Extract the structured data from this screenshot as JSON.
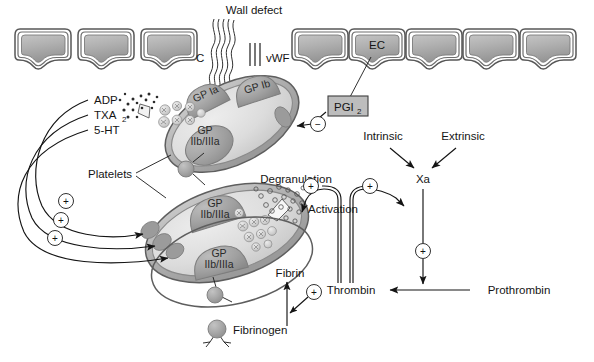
{
  "figure": {
    "title": "Wall defect",
    "background_color": "#ffffff"
  },
  "colors": {
    "cell_fill_light": "#b9b9b9",
    "cell_fill_dark": "#9a9a9a",
    "cell_border": "#6e6e6e",
    "cell_outline": "#4d4d4d",
    "platelet_fill": "#d9d9d9",
    "platelet_membrane": "#a8a8a8",
    "receptor_fill": "#9d9d9d",
    "granule_fill": "#c9c9c9",
    "sphere_fill": "#a3a3a3",
    "line": "#1a1a1a",
    "box_fill": "#bdbdbd",
    "text": "#151515"
  },
  "labels": {
    "wall_defect": "Wall defect",
    "collagen": "C",
    "vwf": "vWF",
    "endothelial_cell": "EC",
    "pgi2": "PGI",
    "pgi2_sub": "2",
    "adp": "ADP",
    "txa2": "TXA",
    "txa2_sub": "2",
    "serotonin": "5-HT",
    "platelets": "Platelets",
    "gp_ia": "GP Ia",
    "gp_ib": "GP Ib",
    "gp_iibiiia": "GP",
    "gp_iibiiia_second": "IIb/IIIa",
    "degranulation": "Degranulation",
    "activation": "Activation",
    "intrinsic": "Intrinsic",
    "extrinsic": "Extrinsic",
    "xa": "Xa",
    "thrombin": "Thrombin",
    "prothrombin": "Prothrombin",
    "fibrin": "Fibrin",
    "fibrinogen": "Fibrinogen",
    "plus": "+",
    "minus": "−"
  },
  "diagram_data": {
    "type": "biological-pathway-diagram",
    "endothelial_cells_left": 3,
    "endothelial_cells_right": 5,
    "platelets": 3,
    "receptors": [
      "GP Ia",
      "GP Ib",
      "GP IIb/IIIa"
    ],
    "released_mediators": [
      "ADP",
      "TXA2",
      "5-HT"
    ],
    "positive_signs": 7,
    "negative_signs": 1,
    "coagulation_pathways": [
      "Intrinsic",
      "Extrinsic"
    ],
    "cascade_steps": [
      "Xa",
      "Prothrombin",
      "Thrombin",
      "Fibrinogen",
      "Fibrin"
    ]
  }
}
